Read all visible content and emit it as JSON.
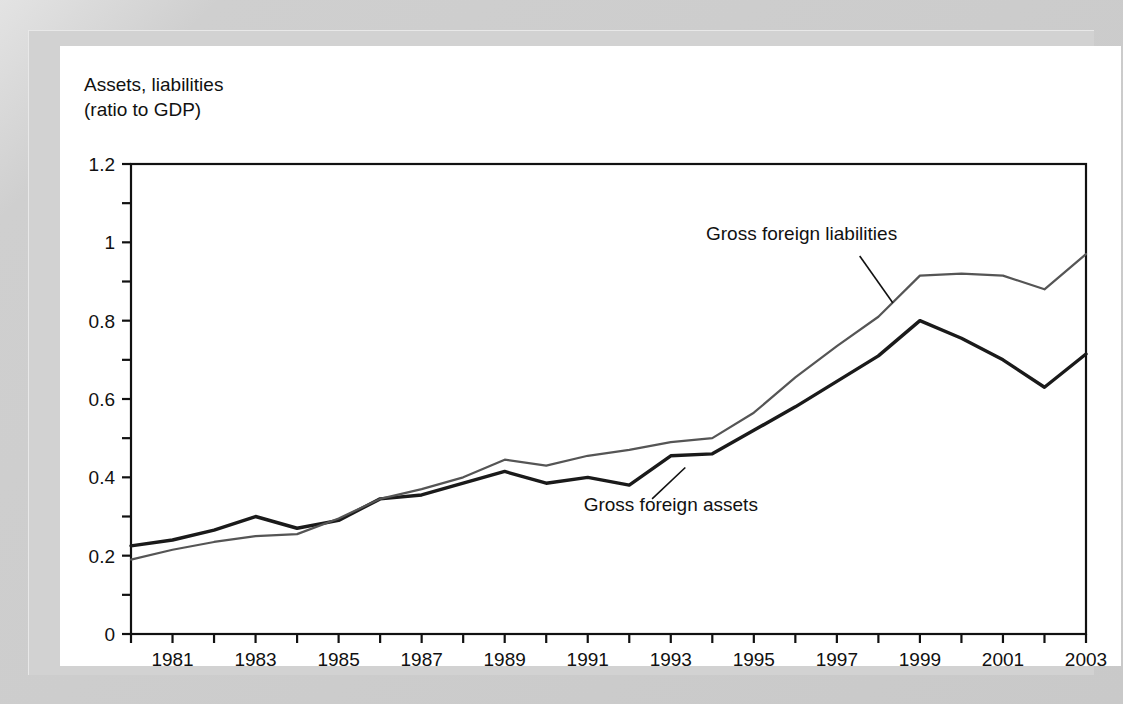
{
  "figure": {
    "axis_title_line1": "Assets, liabilities",
    "axis_title_line2": "(ratio to GDP)",
    "background_color": "#cfcfcf",
    "panel_color": "#ffffff"
  },
  "chart_data": {
    "type": "line",
    "title": "",
    "xlabel": "",
    "ylabel": "Assets, liabilities (ratio to GDP)",
    "xlim": [
      1980,
      2003
    ],
    "ylim": [
      0,
      1.2
    ],
    "grid": false,
    "legend_position": "inline-annotations",
    "x": [
      1980,
      1981,
      1982,
      1983,
      1984,
      1985,
      1986,
      1987,
      1988,
      1989,
      1990,
      1991,
      1992,
      1993,
      1994,
      1995,
      1996,
      1997,
      1998,
      1999,
      2000,
      2001,
      2002,
      2003
    ],
    "x_tick_labels": [
      "1981",
      "1983",
      "1985",
      "1987",
      "1989",
      "1991",
      "1993",
      "1995",
      "1997",
      "1999",
      "2001",
      "2003"
    ],
    "x_tick_values": [
      1981,
      1983,
      1985,
      1987,
      1989,
      1991,
      1993,
      1995,
      1997,
      1999,
      2001,
      2003
    ],
    "x_minor_tick_values": [
      1980,
      1982,
      1984,
      1986,
      1988,
      1990,
      1992,
      1994,
      1996,
      1998,
      2000,
      2002
    ],
    "y_tick_labels": [
      "0",
      "0.2",
      "0.4",
      "0.6",
      "0.8",
      "1",
      "1.2"
    ],
    "y_tick_values": [
      0,
      0.2,
      0.4,
      0.6,
      0.8,
      1.0,
      1.2
    ],
    "y_minor_tick_values": [
      0.1,
      0.3,
      0.5,
      0.7,
      0.9,
      1.1
    ],
    "series": [
      {
        "name": "Gross foreign assets",
        "color": "#1a1a1a",
        "line_width": 3.4,
        "values": [
          0.225,
          0.24,
          0.265,
          0.3,
          0.27,
          0.29,
          0.345,
          0.355,
          0.385,
          0.415,
          0.385,
          0.4,
          0.38,
          0.455,
          0.46,
          0.52,
          0.58,
          0.645,
          0.71,
          0.8,
          0.755,
          0.7,
          0.63,
          0.715
        ]
      },
      {
        "name": "Gross foreign liabilities",
        "color": "#555555",
        "line_width": 2.2,
        "values": [
          0.19,
          0.215,
          0.235,
          0.25,
          0.255,
          0.295,
          0.345,
          0.37,
          0.4,
          0.445,
          0.43,
          0.455,
          0.47,
          0.49,
          0.5,
          0.565,
          0.655,
          0.735,
          0.81,
          0.915,
          0.92,
          0.915,
          0.88,
          0.97
        ]
      }
    ],
    "annotations": [
      {
        "text": "Gross foreign liabilities",
        "label_x": 1996.15,
        "label_y": 1.005,
        "leader_from": [
          1997.55,
          0.965
        ],
        "leader_to": [
          1998.35,
          0.845
        ]
      },
      {
        "text": "Gross foreign assets",
        "label_x": 1993.0,
        "label_y": 0.315,
        "leader_from": [
          1992.55,
          0.345
        ],
        "leader_to": [
          1993.35,
          0.425
        ]
      }
    ]
  }
}
